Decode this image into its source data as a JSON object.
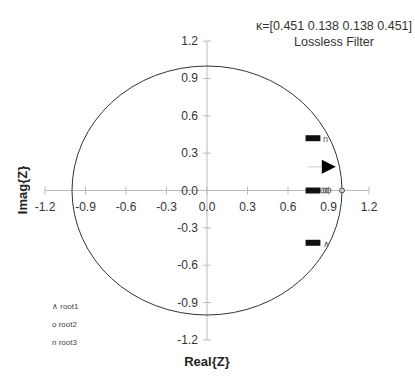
{
  "chart_data": {
    "type": "scatter",
    "title": "κ=[0.451 0.138 0.138 0.451]",
    "subtitle": "Lossless Filter",
    "xlabel": "Real{Z}",
    "ylabel": "Imag{Z}",
    "xlim": [
      -1.2,
      1.2
    ],
    "ylim": [
      -1.2,
      1.2
    ],
    "x_ticks": [
      "-1.2",
      "-0.9",
      "-0.6",
      "-0.3",
      "0.0",
      "0.3",
      "0.6",
      "0.9",
      "1.2"
    ],
    "y_ticks": [
      "1.2",
      "0.9",
      "0.6",
      "0.3",
      "0.0",
      "-0.3",
      "-0.6",
      "-0.9",
      "-1.2"
    ],
    "grid": false,
    "unit_circle": true,
    "legend": [
      {
        "marker": "∧",
        "label": "root1"
      },
      {
        "marker": "o",
        "label": "root2"
      },
      {
        "marker": "n",
        "label": "root3"
      }
    ],
    "legend_position": "lower-left",
    "series": [
      {
        "name": "root1",
        "marker": "∧",
        "points": [
          [
            0.73,
            -0.42
          ],
          [
            0.78,
            -0.42
          ],
          [
            0.83,
            -0.42
          ],
          [
            0.88,
            -0.43
          ]
        ]
      },
      {
        "name": "root2",
        "marker": "o",
        "points": [
          [
            0.73,
            0.0
          ],
          [
            0.8,
            0.0
          ],
          [
            0.87,
            0.0
          ],
          [
            0.9,
            0.0
          ],
          [
            1.0,
            0.0
          ]
        ]
      },
      {
        "name": "root3",
        "marker": "n",
        "points": [
          [
            0.73,
            0.42
          ],
          [
            0.78,
            0.42
          ],
          [
            0.83,
            0.42
          ],
          [
            0.88,
            0.43
          ]
        ]
      }
    ],
    "annotations": [
      {
        "type": "arrow",
        "direction": "right",
        "x": 0.88,
        "y": 0.19
      }
    ]
  }
}
